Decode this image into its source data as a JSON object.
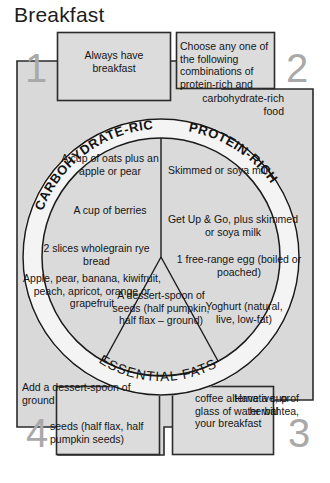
{
  "page": {
    "title": "Breakfast"
  },
  "corners": [
    {
      "number": "1",
      "text": "Always have breakfast"
    },
    {
      "number": "2",
      "text": "Choose any one of the following combinations of protein-rich and",
      "text_continued": "carbohydrate-rich food"
    },
    {
      "number": "3",
      "text_lead": "Have a cup of herbal tea,",
      "text": "coffee alternative, or glass of water with your breakfast"
    },
    {
      "number": "4",
      "text": "Add a dessert-spoon of ground",
      "text_continued": "seeds (half flax, half pumpkin seeds)"
    }
  ],
  "wheel": {
    "segments": [
      {
        "label": "CARBOHYDRATE-RICH",
        "items": [
          "A cup of oats plus an apple or pear",
          "A cup of berries",
          "2 slices wholegrain rye bread",
          "Apple, pear, banana, kiwifruit, peach, apricot, orange or grapefruit"
        ]
      },
      {
        "label": "PROTEIN-RICH",
        "items": [
          "Skimmed or soya milk",
          "Get Up & Go, plus skimmed or soya milk",
          "1 free-range egg (boiled or poached)",
          "Yoghurt (natural, live, low-fat)"
        ]
      },
      {
        "label": "ESSENTIAL FATS",
        "items": [
          "A dessert-spoon of seeds (half pumpkin, half flax – ground)"
        ]
      }
    ]
  },
  "colors": {
    "frame_fill": "#d9d9d9",
    "ring_fill": "#f2f2f2",
    "segment_fill": "#d9d9d9",
    "stroke": "#1a1a1a",
    "number": "#a9a9a9",
    "background": "#ffffff"
  }
}
